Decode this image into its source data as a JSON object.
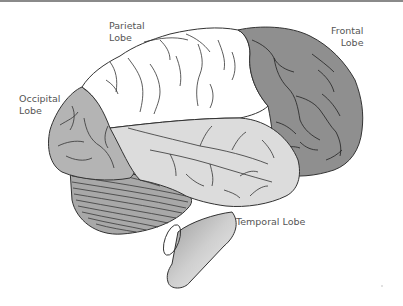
{
  "diagram": {
    "labels": {
      "parietal": {
        "line1": "Parietal",
        "line2": "Lobe"
      },
      "occipital": {
        "line1": "Occipital",
        "line2": "Lobe"
      },
      "frontal": {
        "line1": "Frontal",
        "line2": "Lobe"
      },
      "temporal": {
        "line1": "Temporal Lobe"
      }
    },
    "colors": {
      "frontal": "#8f8f8f",
      "parietal": "#ffffff",
      "occipital": "#b4b4b4",
      "temporal": "#dcdcdc",
      "cerebellum": "#a8a8a8",
      "brainstem": "#d6d6d6",
      "outline": "#333333",
      "label_text": "#555555",
      "top_rule": "#8a8a8a"
    }
  }
}
